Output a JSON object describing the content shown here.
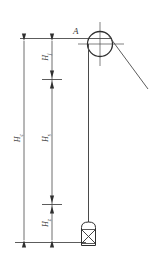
{
  "diagram": {
    "stroke_color": "#4a4a4a",
    "text_color": "#3a3a3a",
    "background_color": "#ffffff",
    "points": {
      "pulley_label": "A"
    },
    "dimensions": [
      {
        "name": "total-height",
        "symbol": "H",
        "subscript": "c",
        "label": "Hc",
        "position": "outer-left"
      },
      {
        "name": "upper-overrun",
        "symbol": "H",
        "subscript": "j",
        "label": "Hj",
        "position": "inner-upper"
      },
      {
        "name": "hoisting-height",
        "symbol": "H",
        "subscript": "s",
        "label": "Hs",
        "position": "inner-middle"
      },
      {
        "name": "lower-depth",
        "symbol": "H",
        "subscript": "z",
        "label": "Hz",
        "position": "inner-lower"
      }
    ],
    "components": {
      "pulley": "sheave-wheel",
      "rope": "hoisting-rope",
      "load": "skip-bucket",
      "incline": "rope-to-drum"
    }
  }
}
